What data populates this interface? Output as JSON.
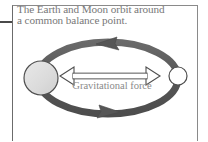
{
  "figure": {
    "title": "The Earth and Moon orbit around a common balance point.",
    "caption_line_1": "The Earth and Moon orbit around",
    "caption_line_2": "a common balance point.",
    "caption_text": "The Earth and Moon orbit around\na common balance point.",
    "force_label": "Gravitational force",
    "bodies": {
      "earth": {
        "name": "Earth",
        "shape": "circle",
        "fill": "#dcdcdc",
        "stroke": "#555555",
        "cx": 41,
        "cy": 78,
        "r": 17
      },
      "moon": {
        "name": "Moon",
        "shape": "circle",
        "fill": "#ffffff",
        "stroke": "#555555",
        "cx": 178,
        "cy": 76,
        "r": 9
      }
    },
    "orbit": {
      "name": "orbit-ellipse",
      "cx": 108,
      "cy": 78,
      "rx": 70,
      "ry": 36,
      "band_color": "#5e5e5e",
      "band_width": 7,
      "arrow_top_direction": "left",
      "arrow_bottom_direction": "right"
    },
    "force_arrow": {
      "name": "gravitational-force-arrow",
      "fill": "#ffffff",
      "stroke": "#4f4f4f",
      "x1": 60,
      "x2": 160,
      "y": 76,
      "double_headed": true
    },
    "colors": {
      "frame": "#6b6b6b",
      "caption_text": "#787878",
      "label_text": "#8a8a8a",
      "orbit": "#5e5e5e",
      "earth_fill": "#dcdcdc",
      "moon_fill": "#ffffff",
      "background": "#ffffff"
    }
  }
}
